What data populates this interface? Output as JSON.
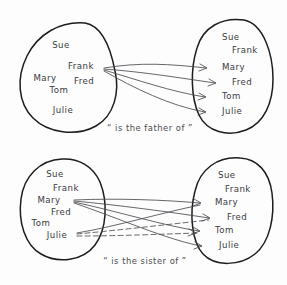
{
  "figure": {
    "background_color": "#fdfdfd",
    "ink_color": "#1d1d1d",
    "arrow_color": "#4a4a52",
    "style": "hand-drawn sketch"
  },
  "diagrams": [
    {
      "id": "father-of",
      "caption": "“ is the father of ”",
      "caption_x": 150,
      "caption_y": 131,
      "domain": {
        "label": "domain-set",
        "shape": "teardrop-oval",
        "members": [
          {
            "name": "Sue",
            "x": 61,
            "y": 48
          },
          {
            "name": "Frank",
            "x": 81,
            "y": 69
          },
          {
            "name": "Mary",
            "x": 45,
            "y": 81
          },
          {
            "name": "Fred",
            "x": 84,
            "y": 84
          },
          {
            "name": "Tom",
            "x": 59,
            "y": 93
          },
          {
            "name": "Julie",
            "x": 63,
            "y": 113
          }
        ]
      },
      "codomain": {
        "label": "codomain-set",
        "shape": "round-oval",
        "members": [
          {
            "name": "Sue",
            "x": 222,
            "y": 40
          },
          {
            "name": "Frank",
            "x": 232,
            "y": 53
          },
          {
            "name": "Mary",
            "x": 222,
            "y": 70
          },
          {
            "name": "Fred",
            "x": 232,
            "y": 85
          },
          {
            "name": "Tom",
            "x": 222,
            "y": 99
          },
          {
            "name": "Julie",
            "x": 222,
            "y": 114
          }
        ]
      },
      "arrows": [
        {
          "from": "Frank",
          "to": "Mary",
          "style": "solid",
          "d": "M 104,68 C 140,62 170,64 206,68"
        },
        {
          "from": "Frank",
          "to": "Fred",
          "style": "solid",
          "d": "M 104,69 C 145,72 180,78 215,83"
        },
        {
          "from": "Frank",
          "to": "Tom",
          "style": "solid",
          "d": "M 104,70 C 138,80 172,92 205,97"
        },
        {
          "from": "Frank",
          "to": "Julie",
          "style": "solid",
          "d": "M 104,71 C 134,88 170,106 205,112"
        }
      ]
    },
    {
      "id": "sister-of",
      "caption": "“ is the sister of ”",
      "caption_x": 145,
      "caption_y": 264,
      "domain": {
        "label": "domain-set",
        "shape": "round-oval",
        "members": [
          {
            "name": "Sue",
            "x": 55,
            "y": 177
          },
          {
            "name": "Frank",
            "x": 66,
            "y": 191
          },
          {
            "name": "Mary",
            "x": 49,
            "y": 203
          },
          {
            "name": "Fred",
            "x": 61,
            "y": 215
          },
          {
            "name": "Tom",
            "x": 41,
            "y": 226
          },
          {
            "name": "Julie",
            "x": 57,
            "y": 238
          }
        ]
      },
      "codomain": {
        "label": "codomain-set",
        "shape": "round-oval",
        "members": [
          {
            "name": "Sue",
            "x": 218,
            "y": 178
          },
          {
            "name": "Frank",
            "x": 225,
            "y": 192
          },
          {
            "name": "Mary",
            "x": 215,
            "y": 205
          },
          {
            "name": "Fred",
            "x": 227,
            "y": 220
          },
          {
            "name": "Tom",
            "x": 215,
            "y": 233
          },
          {
            "name": "Julie",
            "x": 219,
            "y": 248
          }
        ]
      },
      "arrows": [
        {
          "from": "Mary",
          "to": "Mary",
          "style": "solid",
          "d": "M 74,200 C 118,198 165,200 200,203"
        },
        {
          "from": "Mary",
          "to": "Fred",
          "style": "solid",
          "d": "M 74,201 C 118,205 170,212 209,218"
        },
        {
          "from": "Mary",
          "to": "Tom",
          "style": "solid",
          "d": "M 74,202 C 120,212 165,226 199,231"
        },
        {
          "from": "Mary",
          "to": "Julie",
          "style": "solid",
          "d": "M 74,203 C 118,218 168,240 201,246"
        },
        {
          "from": "Julie",
          "to": "Mary",
          "style": "solid",
          "d": "M 77,233 C 118,226 165,212 200,205"
        },
        {
          "from": "Julie",
          "to": "Fred",
          "style": "dashed",
          "d": "M 77,234 C 120,230 172,224 209,220"
        },
        {
          "from": "Julie",
          "to": "Tom",
          "style": "dashed",
          "d": "M 77,236 C 120,236 165,234 199,233"
        }
      ]
    }
  ]
}
